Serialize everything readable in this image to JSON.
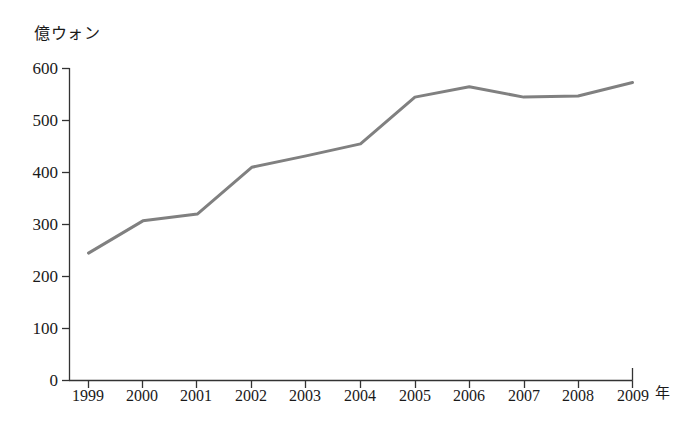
{
  "chart_data": {
    "type": "line",
    "title": "",
    "subtitle": "",
    "ylabel": "億ウォン",
    "xlabel": "年",
    "categories": [
      "1999",
      "2000",
      "2001",
      "2002",
      "2003",
      "2004",
      "2005",
      "2006",
      "2007",
      "2008",
      "2009"
    ],
    "values": [
      245,
      307,
      320,
      410,
      432,
      455,
      545,
      565,
      545,
      547,
      573
    ],
    "series": [
      {
        "name": "",
        "values": [
          245,
          307,
          320,
          410,
          432,
          455,
          545,
          565,
          545,
          547,
          573
        ]
      }
    ],
    "ylim": [
      0,
      600
    ],
    "yticks": [
      0,
      100,
      200,
      300,
      400,
      500,
      600
    ],
    "ytick_labels": [
      "0",
      "100",
      "200",
      "300",
      "400",
      "500",
      "600"
    ],
    "xtick_labels": [
      "1999",
      "2000",
      "2001",
      "2002",
      "2003",
      "2004",
      "2005",
      "2006",
      "2007",
      "2008",
      "2009"
    ],
    "grid": false,
    "legend": false,
    "legend_position": "none",
    "line_color": "#808080",
    "axis_color": "#333333",
    "background_color": "#ffffff",
    "markers": false,
    "annotations": []
  },
  "axis": {
    "y_title": "億ウォン",
    "x_title": "年"
  }
}
